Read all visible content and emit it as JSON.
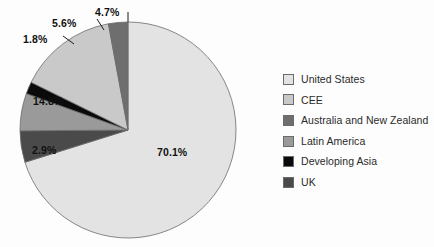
{
  "chart_data": {
    "type": "pie",
    "title": "",
    "legend_position": "right",
    "categories": [
      "United States",
      "CEE",
      "Australia and New Zealand",
      "Latin America",
      "Developing Asia",
      "UK"
    ],
    "values": [
      70.1,
      14.8,
      2.9,
      5.6,
      1.8,
      4.7
    ],
    "value_labels": [
      "70.1%",
      "14.8%",
      "2.9%",
      "5.6%",
      "1.8%",
      "4.7%"
    ],
    "colors": [
      "#e3e3e3",
      "#c9c9c9",
      "#6e6e6e",
      "#9a9a9a",
      "#0a0a0a",
      "#4a4a4a"
    ],
    "units": "percent",
    "slices": [
      {
        "name": "United States",
        "value": 70.1,
        "label": "70.1%",
        "color": "#e3e3e3"
      },
      {
        "name": "UK",
        "value": 4.7,
        "label": "4.7%",
        "color": "#4a4a4a"
      },
      {
        "name": "Latin America",
        "value": 5.6,
        "label": "5.6%",
        "color": "#9a9a9a"
      },
      {
        "name": "Developing Asia",
        "value": 1.8,
        "label": "1.8%",
        "color": "#0a0a0a"
      },
      {
        "name": "CEE",
        "value": 14.8,
        "label": "14.8%",
        "color": "#c9c9c9"
      },
      {
        "name": "Australia and New Zealand",
        "value": 2.9,
        "label": "2.9%",
        "color": "#6e6e6e"
      }
    ]
  },
  "legend": {
    "items": [
      {
        "label": "United States",
        "color": "#e3e3e3"
      },
      {
        "label": "CEE",
        "color": "#c9c9c9"
      },
      {
        "label": "Australia and New Zealand",
        "color": "#6e6e6e"
      },
      {
        "label": "Latin America",
        "color": "#9a9a9a"
      },
      {
        "label": "Developing Asia",
        "color": "#0a0a0a"
      },
      {
        "label": "UK",
        "color": "#4a4a4a"
      }
    ]
  },
  "labels": {
    "us": "70.1%",
    "cee": "14.8%",
    "anz": "2.9%",
    "latam": "5.6%",
    "asia": "1.8%",
    "uk": "4.7%"
  }
}
